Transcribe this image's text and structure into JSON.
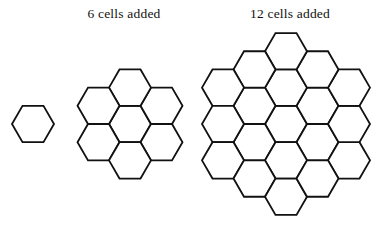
{
  "figure": {
    "background_color": "#ffffff",
    "stroke_color": "#111111",
    "stroke_width": 1.8,
    "width": 378,
    "height": 236
  },
  "labels": {
    "six_cells_added": "6 cells added",
    "twelve_cells_added": "12 cells added"
  },
  "chart_data": {
    "type": "diagram",
    "orientation": "flat-top",
    "annotations": [
      "6 cells added",
      "12 cells added"
    ],
    "stages": [
      {
        "name": "stage-1",
        "cell_count": 1,
        "added": 0,
        "rings": 0,
        "label": "",
        "columns": [
          1
        ]
      },
      {
        "name": "stage-2",
        "cell_count": 7,
        "added": 6,
        "rings": 1,
        "label": "6 cells added",
        "columns": [
          2,
          3,
          2
        ]
      },
      {
        "name": "stage-3",
        "cell_count": 19,
        "added": 12,
        "rings": 2,
        "label": "12 cells added",
        "columns": [
          3,
          4,
          5,
          4,
          3
        ]
      }
    ],
    "geometry": {
      "single": {
        "center_x": 33,
        "center_y": 124,
        "radius": 21,
        "cells": [
          [
            0,
            0
          ]
        ]
      },
      "seven": {
        "center_x": 130,
        "center_y": 124,
        "radius": 21,
        "cells": [
          [
            0,
            0
          ],
          [
            1,
            0
          ],
          [
            1,
            -1
          ],
          [
            0,
            -1
          ],
          [
            -1,
            0
          ],
          [
            -1,
            1
          ],
          [
            0,
            1
          ]
        ]
      },
      "nineteen": {
        "center_x": 286,
        "center_y": 124,
        "radius": 21,
        "cells": [
          [
            0,
            0
          ],
          [
            1,
            0
          ],
          [
            1,
            -1
          ],
          [
            0,
            -1
          ],
          [
            -1,
            0
          ],
          [
            -1,
            1
          ],
          [
            0,
            1
          ],
          [
            2,
            0
          ],
          [
            2,
            -1
          ],
          [
            2,
            -2
          ],
          [
            1,
            -2
          ],
          [
            0,
            -2
          ],
          [
            -1,
            -1
          ],
          [
            -2,
            0
          ],
          [
            -2,
            1
          ],
          [
            -2,
            2
          ],
          [
            -1,
            2
          ],
          [
            0,
            2
          ],
          [
            1,
            1
          ]
        ]
      }
    }
  }
}
